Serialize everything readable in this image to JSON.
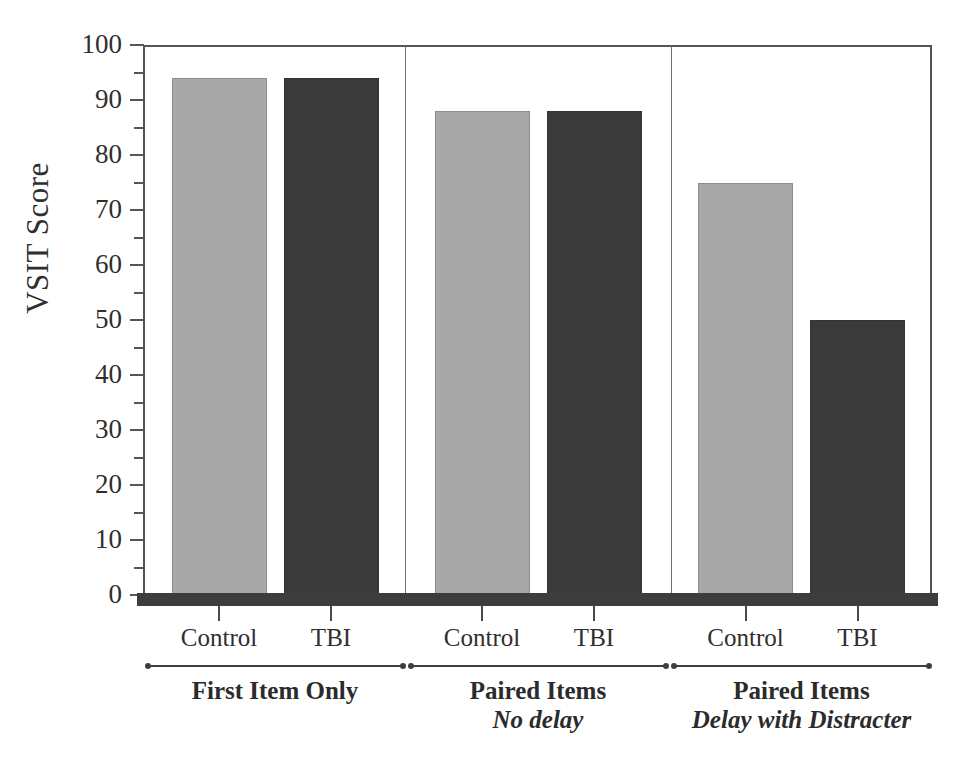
{
  "chart_data": {
    "type": "bar",
    "title": "",
    "xlabel": "",
    "ylabel": "VSIT Score",
    "ylim": [
      0,
      100
    ],
    "ytick_step": 10,
    "yticks": [
      0,
      10,
      20,
      30,
      40,
      50,
      60,
      70,
      80,
      90,
      100
    ],
    "minor_ticks": [
      5,
      15,
      25,
      35,
      45,
      55,
      65,
      75,
      85,
      95
    ],
    "grid": false,
    "legend": "none",
    "categories": [
      "First Item Only",
      "Paired Items No delay",
      "Paired Items Delay with Distracter"
    ],
    "series": [
      {
        "name": "Control",
        "color": "#a8a8a8",
        "values": [
          94,
          88,
          75
        ]
      },
      {
        "name": "TBI",
        "color": "#3a3a3a",
        "values": [
          94,
          88,
          50
        ]
      }
    ],
    "groups": [
      {
        "caption_line1": "First Item Only",
        "caption_line2": "",
        "bars": [
          {
            "series": "Control",
            "label": "Control",
            "value": 94
          },
          {
            "series": "TBI",
            "label": "TBI",
            "value": 94
          }
        ]
      },
      {
        "caption_line1": "Paired Items",
        "caption_line2": "No delay",
        "bars": [
          {
            "series": "Control",
            "label": "Control",
            "value": 88
          },
          {
            "series": "TBI",
            "label": "TBI",
            "value": 88
          }
        ]
      },
      {
        "caption_line1": "Paired Items",
        "caption_line2": "Delay with Distracter",
        "bars": [
          {
            "series": "Control",
            "label": "Control",
            "value": 75
          },
          {
            "series": "TBI",
            "label": "TBI",
            "value": 50
          }
        ]
      }
    ]
  },
  "axis": {
    "y_title": "VSIT Score",
    "y_labels": [
      "100",
      "90",
      "80",
      "70",
      "60",
      "50",
      "40",
      "30",
      "20",
      "10",
      "0"
    ]
  },
  "colors": {
    "control_fill": "#a8a8a8",
    "tbi_fill": "#3a3a3a",
    "axis": "#555555",
    "baseline": "#3d3d3d",
    "text": "#2b2b2b",
    "background": "#ffffff"
  }
}
